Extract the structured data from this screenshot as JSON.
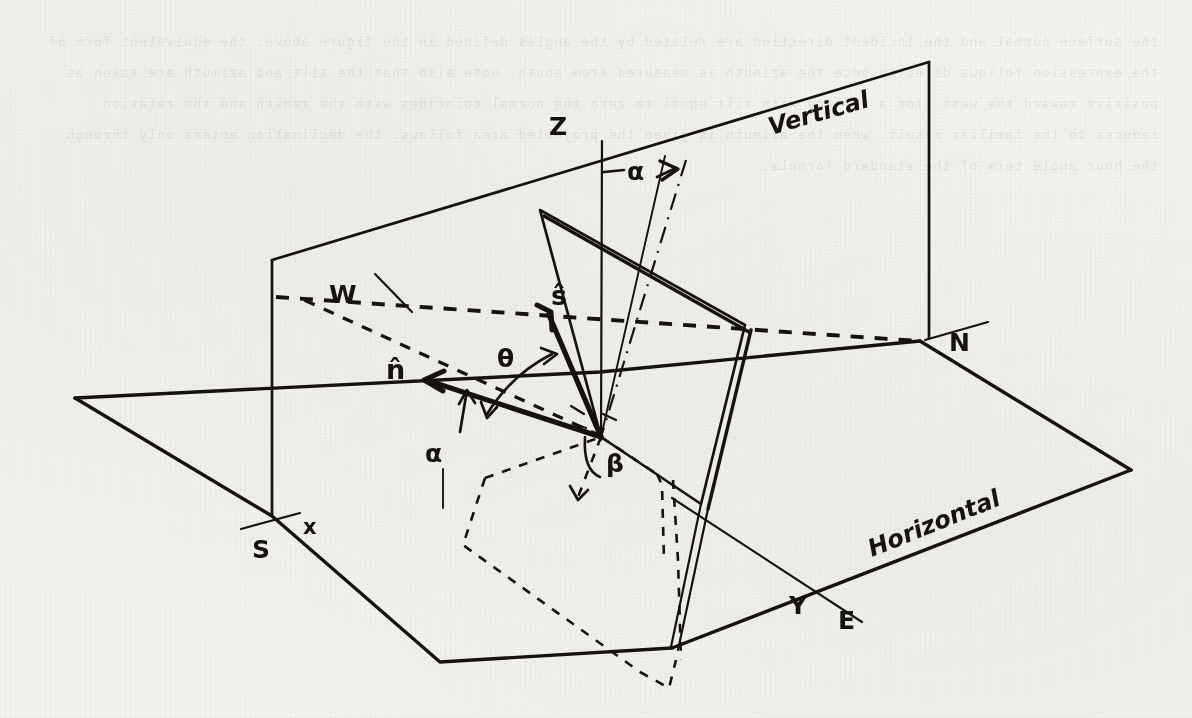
{
  "figure": {
    "kind": "hand-drawn-physics-diagram",
    "title_visible": false,
    "background_color": "#f3f2ee",
    "ink_color": "#16130f",
    "width": 1192,
    "height": 718,
    "bleed_through_text": "the surface normal and the incident direction are related by the angles defined in the figure above. the equivalent form of the expression follows directly once the azimuth is measured from south. note also that the tilt and azimuth are taken as positive toward the west. for a surface with tilt equal to zero the normal coincides with the zenith and the relation reduces to the familiar result. when the azimuth is given the projected area follows. the declination enters only through the hour angle term of the standard formula."
  },
  "planes": {
    "horizontal_label": "Horizontal",
    "vertical_label": "Vertical"
  },
  "axes": [
    {
      "name": "z-axis",
      "label": "Z",
      "description": "zenith / vertical axis"
    },
    {
      "name": "north-axis",
      "label": "N",
      "description": "north direction in horizontal plane"
    },
    {
      "name": "south-axis",
      "label": "S",
      "description": "south direction in horizontal plane"
    },
    {
      "name": "east-axis",
      "label": "E",
      "description": "east direction in horizontal plane"
    },
    {
      "name": "west-axis",
      "label": "W",
      "description": "west direction, dashed"
    },
    {
      "name": "x-axis",
      "label": "x",
      "description": "x coordinate tick near south"
    },
    {
      "name": "y-axis",
      "label": "Y",
      "description": "y coordinate tick near east"
    }
  ],
  "vectors": [
    {
      "name": "surface-normal",
      "label": "n̂",
      "description": "unit normal of the tilted surface"
    },
    {
      "name": "sun-direction",
      "label": "ŝ",
      "description": "unit vector toward the sun"
    }
  ],
  "angles": [
    {
      "name": "tilt-angle-vertical",
      "label": "α",
      "description": "tilt of surface normal from zenith, measured at Z axis"
    },
    {
      "name": "tilt-angle-horizontal",
      "label": "α",
      "description": "azimuth of surface normal measured in horizontal plane"
    },
    {
      "name": "incidence-angle",
      "label": "θ",
      "description": "angle between n-hat and s-hat"
    },
    {
      "name": "solar-azimuth",
      "label": "β",
      "description": "azimuth angle of sun projection in horizontal plane"
    }
  ],
  "elements": {
    "tilted_plate": "tilted rectangular surface drawn with doubled edges to suggest thickness",
    "dashed_projection": "dashed outline of the tilted plate projected onto the horizontal plane",
    "dash_dot_line": "dash-dot construction line through the origin parallel to the surface normal"
  }
}
